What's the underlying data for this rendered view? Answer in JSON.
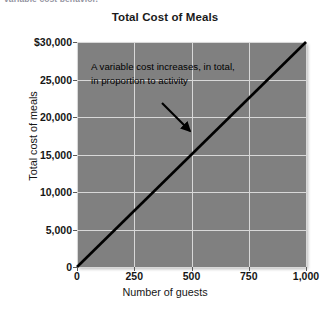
{
  "page": {
    "cutoff_text": "variable cost behavior."
  },
  "chart_data": {
    "type": "line",
    "title": "Total Cost of Meals",
    "xlabel": "Number of guests",
    "ylabel": "Total cost of meals",
    "xlim": [
      0,
      1000
    ],
    "ylim": [
      0,
      30000
    ],
    "grid": true,
    "legend": "none",
    "x_ticks": [
      0,
      250,
      500,
      750,
      1000
    ],
    "x_tick_labels": [
      "0",
      "250",
      "500",
      "750",
      "1,000"
    ],
    "y_ticks": [
      0,
      5000,
      10000,
      15000,
      20000,
      25000,
      30000
    ],
    "y_tick_labels": [
      "0",
      "5,000",
      "10,000",
      "15,000",
      "20,000",
      "25,000",
      "$30,000"
    ],
    "series": [
      {
        "name": "Total cost of meals",
        "color": "#000000",
        "x": [
          0,
          1000
        ],
        "values": [
          0,
          30000
        ]
      }
    ],
    "annotations": [
      {
        "text": "A variable cost increases, in total, in proportion to activity",
        "arrow_from": [
          370,
          25600
        ],
        "arrow_to": [
          500,
          15000
        ]
      }
    ],
    "plot_background": "#808080",
    "gridline_color": "#d8d8d8"
  }
}
